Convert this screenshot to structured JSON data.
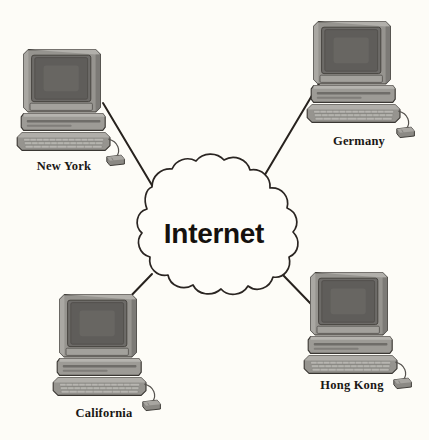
{
  "diagram": {
    "type": "network-topology",
    "background_color": "#fdfcf7",
    "line_color": "#27221e",
    "cloud": {
      "label": "Internet",
      "fill_color": "#fefdf9",
      "stroke_color": "#2a2522",
      "center": {
        "x": 214,
        "y": 232
      }
    },
    "nodes": [
      {
        "id": "new-york",
        "label": "New York",
        "icon": "desktop-computer-icon",
        "position": {
          "x": 22,
          "y": 48
        },
        "label_position": {
          "x": 64,
          "y": 170
        },
        "connector": {
          "x1": 100,
          "y1": 101,
          "x2": 152,
          "y2": 186
        }
      },
      {
        "id": "germany",
        "label": "Germany",
        "icon": "desktop-computer-icon",
        "position": {
          "x": 312,
          "y": 20
        },
        "label_position": {
          "x": 359,
          "y": 145
        },
        "connector": {
          "x1": 318,
          "y1": 80,
          "x2": 262,
          "y2": 177
        }
      },
      {
        "id": "california",
        "label": "California",
        "icon": "desktop-computer-icon",
        "position": {
          "x": 58,
          "y": 293
        },
        "label_position": {
          "x": 104,
          "y": 417
        },
        "connector": {
          "x1": 124,
          "y1": 303,
          "x2": 151,
          "y2": 275
        }
      },
      {
        "id": "hong-kong",
        "label": "Hong Kong",
        "icon": "desktop-computer-icon",
        "position": {
          "x": 309,
          "y": 271
        },
        "label_position": {
          "x": 352,
          "y": 389
        },
        "connector": {
          "x1": 310,
          "y1": 305,
          "x2": 281,
          "y2": 275
        }
      }
    ],
    "computer_colors": {
      "monitor_bezel": "#8d8b86",
      "monitor_bezel_light": "#a9a7a2",
      "monitor_bezel_dark": "#6c6a66",
      "screen": "#5d5b58",
      "screen_inner": "#6a6865",
      "base_unit": "#9a9893",
      "base_unit_dark": "#7b7975",
      "keyboard": "#92908b",
      "keyboard_dark": "#74726e",
      "key": "#b4b2ad",
      "mouse": "#86847f",
      "outline": "#3a3733"
    }
  }
}
